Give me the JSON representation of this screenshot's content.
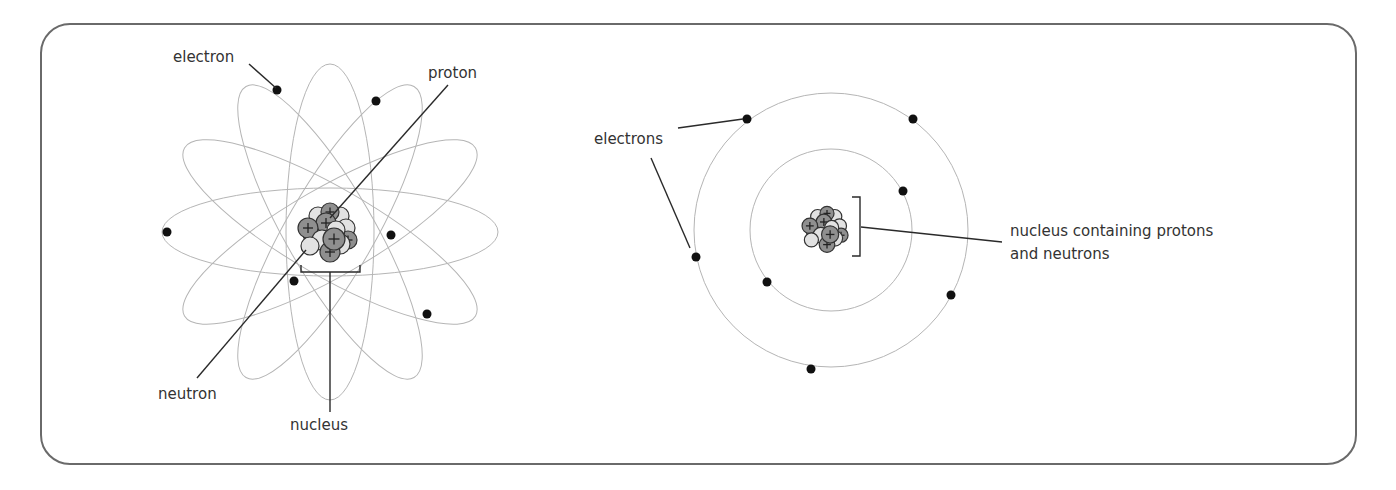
{
  "figure": {
    "left_diagram": {
      "title": "atom with elliptical orbits",
      "labels": {
        "electron": "electron",
        "proton": "proton",
        "neutron": "neutron",
        "nucleus": "nucleus"
      },
      "orbit_count": 6,
      "electron_count": 7
    },
    "right_diagram": {
      "title": "atom with circular shells",
      "labels": {
        "electrons": "electrons",
        "nucleus_line1": "nucleus containing protons",
        "nucleus_line2": "and neutrons"
      },
      "shell_count": 2,
      "inner_shell_electrons": 2,
      "outer_shell_electrons": 6
    }
  },
  "colors": {
    "frame": "#6a6a6a",
    "orbit": "#b5b5b5",
    "electron": "#111111",
    "proton": "#8f8f8f",
    "neutron": "#e2e2e2"
  }
}
